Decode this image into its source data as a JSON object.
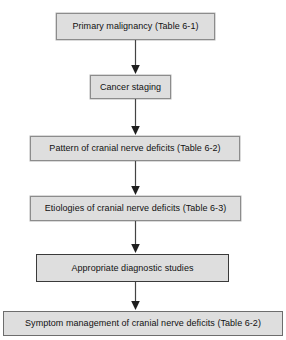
{
  "diagram": {
    "orientation": "vertical top-to-bottom",
    "background_color": "#ffffff",
    "node_fill_color": "#dedede",
    "node_border_color": "#8c8c8c",
    "text_color": "#111111",
    "arrow_color": "#444444",
    "nodes": [
      {
        "id": "primary-malignancy",
        "label": "Primary malignancy (Table 6-1)",
        "shape": "rectangle"
      },
      {
        "id": "cancer-staging",
        "label": "Cancer staging",
        "shape": "rectangle"
      },
      {
        "id": "pattern-cranial-nerve-deficits",
        "label": "Pattern of cranial nerve deficits (Table 6-2)",
        "shape": "rectangle"
      },
      {
        "id": "etiologies-cranial-nerve-deficits",
        "label": "Etiologies of cranial nerve deficits (Table 6-3)",
        "shape": "rectangle"
      },
      {
        "id": "appropriate-diagnostic-studies",
        "label": "Appropriate diagnostic studies",
        "shape": "rectangle"
      },
      {
        "id": "symptom-management",
        "label": "Symptom management of cranial nerve deficits (Table 6-2)",
        "shape": "rectangle"
      }
    ],
    "edges": [
      {
        "from": "primary-malignancy",
        "to": "cancer-staging",
        "style": "solid-arrow"
      },
      {
        "from": "cancer-staging",
        "to": "pattern-cranial-nerve-deficits",
        "style": "solid-arrow"
      },
      {
        "from": "pattern-cranial-nerve-deficits",
        "to": "etiologies-cranial-nerve-deficits",
        "style": "solid-arrow"
      },
      {
        "from": "etiologies-cranial-nerve-deficits",
        "to": "appropriate-diagnostic-studies",
        "style": "solid-arrow"
      },
      {
        "from": "appropriate-diagnostic-studies",
        "to": "symptom-management",
        "style": "solid-arrow"
      }
    ]
  }
}
